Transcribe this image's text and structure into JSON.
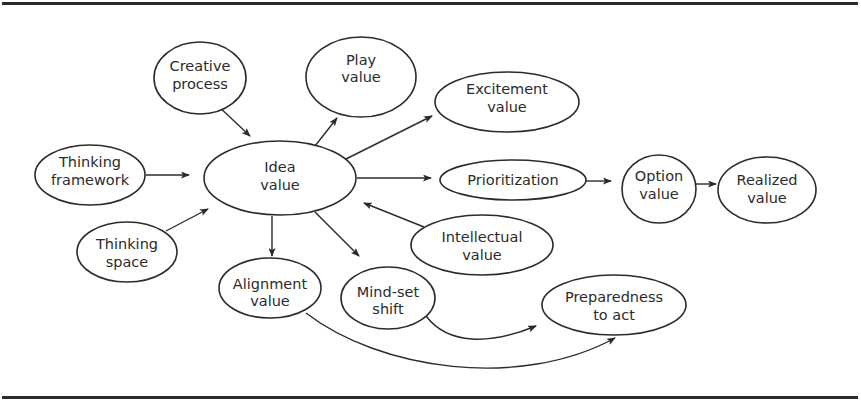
{
  "diagram": {
    "type": "concept-flow",
    "colors": {
      "stroke": "#2b2b2b",
      "background": "#ffffff",
      "rule": "#2a2a2a"
    },
    "nodes": [
      {
        "id": "creative-process",
        "lines": [
          "Creative",
          "process"
        ],
        "cx": 200,
        "cy": 78,
        "rx": 46,
        "ry": 36
      },
      {
        "id": "play-value",
        "lines": [
          "Play",
          "value"
        ],
        "cx": 361,
        "cy": 77,
        "rx": 55,
        "ry": 40
      },
      {
        "id": "excitement-value",
        "lines": [
          "Excitement",
          "value"
        ],
        "cx": 507,
        "cy": 102,
        "rx": 72,
        "ry": 30
      },
      {
        "id": "thinking-framework",
        "lines": [
          "Thinking",
          "framework"
        ],
        "cx": 90,
        "cy": 175,
        "rx": 55,
        "ry": 30
      },
      {
        "id": "idea-value",
        "lines": [
          "Idea",
          "value"
        ],
        "cx": 280,
        "cy": 178,
        "rx": 76,
        "ry": 37
      },
      {
        "id": "prioritization",
        "lines": [
          "Prioritization"
        ],
        "cx": 513,
        "cy": 180,
        "rx": 73,
        "ry": 20
      },
      {
        "id": "option-value",
        "lines": [
          "Option",
          "value"
        ],
        "cx": 659,
        "cy": 189,
        "rx": 37,
        "ry": 34
      },
      {
        "id": "realized-value",
        "lines": [
          "Realized",
          "value"
        ],
        "cx": 767,
        "cy": 190,
        "rx": 49,
        "ry": 33
      },
      {
        "id": "intellectual-value",
        "lines": [
          "Intellectual",
          "value"
        ],
        "cx": 482,
        "cy": 245,
        "rx": 71,
        "ry": 30
      },
      {
        "id": "thinking-space",
        "lines": [
          "Thinking",
          "space"
        ],
        "cx": 127,
        "cy": 252,
        "rx": 50,
        "ry": 30
      },
      {
        "id": "alignment-value",
        "lines": [
          "Alignment",
          "value"
        ],
        "cx": 270,
        "cy": 288,
        "rx": 51,
        "ry": 30
      },
      {
        "id": "mind-set-shift",
        "lines": [
          "Mind-set",
          "shift"
        ],
        "cx": 388,
        "cy": 298,
        "rx": 47,
        "ry": 31
      },
      {
        "id": "preparedness-to-act",
        "lines": [
          "Preparedness",
          "to act"
        ],
        "cx": 614,
        "cy": 305,
        "rx": 72,
        "ry": 30
      }
    ],
    "edges": [
      {
        "from": "creative-process",
        "to": "idea-value"
      },
      {
        "from": "thinking-framework",
        "to": "idea-value"
      },
      {
        "from": "thinking-space",
        "to": "idea-value"
      },
      {
        "from": "idea-value",
        "to": "play-value"
      },
      {
        "from": "idea-value",
        "to": "excitement-value"
      },
      {
        "from": "idea-value",
        "to": "prioritization"
      },
      {
        "from": "intellectual-value",
        "to": "idea-value"
      },
      {
        "from": "idea-value",
        "to": "alignment-value"
      },
      {
        "from": "idea-value",
        "to": "mind-set-shift"
      },
      {
        "from": "prioritization",
        "to": "option-value"
      },
      {
        "from": "option-value",
        "to": "realized-value"
      },
      {
        "from": "mind-set-shift",
        "to": "preparedness-to-act",
        "curved": true
      },
      {
        "from": "alignment-value",
        "to": "preparedness-to-act",
        "curved": true
      }
    ]
  },
  "labels": {
    "creative_process_1": "Creative",
    "creative_process_2": "process",
    "play_value_1": "Play",
    "play_value_2": "value",
    "excitement_value_1": "Excitement",
    "excitement_value_2": "value",
    "thinking_framework_1": "Thinking",
    "thinking_framework_2": "framework",
    "idea_value_1": "Idea",
    "idea_value_2": "value",
    "prioritization_1": "Prioritization",
    "option_value_1": "Option",
    "option_value_2": "value",
    "realized_value_1": "Realized",
    "realized_value_2": "value",
    "intellectual_value_1": "Intellectual",
    "intellectual_value_2": "value",
    "thinking_space_1": "Thinking",
    "thinking_space_2": "space",
    "alignment_value_1": "Alignment",
    "alignment_value_2": "value",
    "mind_set_shift_1": "Mind-set",
    "mind_set_shift_2": "shift",
    "preparedness_1": "Preparedness",
    "preparedness_2": "to act"
  }
}
